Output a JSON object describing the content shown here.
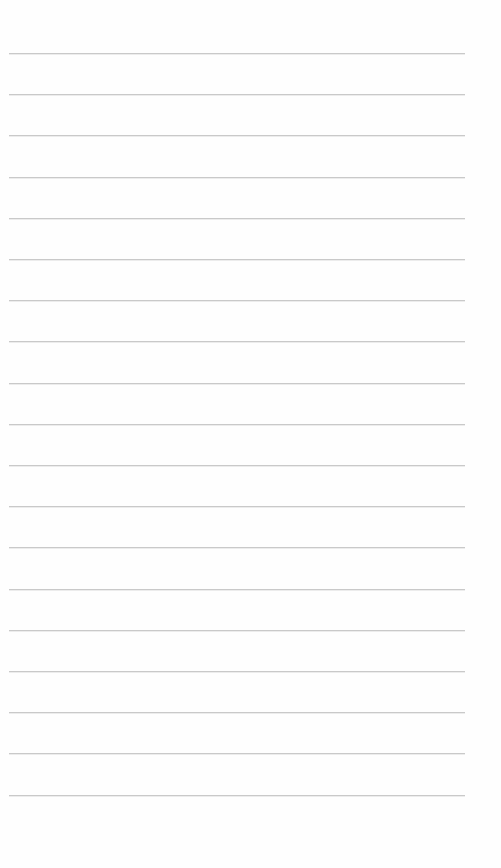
{
  "page": {
    "type": "lined-paper",
    "background_color": "#fefefe",
    "rule_color": "#c9c9c9",
    "rule_count": 19,
    "rule_start_y": 53,
    "rule_spacing": 41.2,
    "rule_left_x": 9,
    "rule_width": 456,
    "text_content": []
  }
}
